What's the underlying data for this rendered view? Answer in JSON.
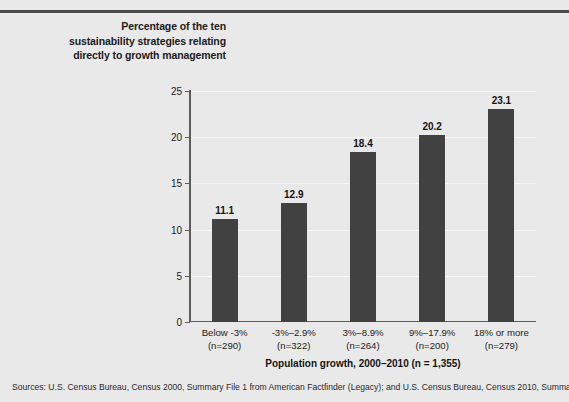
{
  "figure": {
    "top_rule": "horizontal-rule",
    "y_axis_caption": [
      "Percentage of the ten",
      "sustainability strategies relating",
      "directly to growth management"
    ],
    "source_note": "Sources: U.S. Census Bureau, Census 2000, Summary File 1 from American Factfinder (Legacy); and U.S. Census Bureau, Census 2010, Summary",
    "colors": {
      "bar": "#414141",
      "background": "#e9e9e9",
      "axis": "#5b5b5b",
      "gridline": "#f7f7f7",
      "rule": "#4a4a4a"
    }
  },
  "chart_data": {
    "type": "bar",
    "title": "",
    "categories": [
      "Below -3%",
      "-3%–2.9%",
      "3%–8.9%",
      "9%–17.9%",
      "18% or more"
    ],
    "category_sublabels": [
      "(n=290)",
      "(n=322)",
      "(n=264)",
      "(n=200)",
      "(n=279)"
    ],
    "values": [
      11.1,
      12.9,
      18.4,
      20.2,
      23.1
    ],
    "value_labels": [
      "11.1",
      "12.9",
      "18.4",
      "20.2",
      "23.1"
    ],
    "xlabel": "Population growth, 2000–2010 (n = 1,355)",
    "ylabel": "Percentage of the ten sustainability strategies relating directly to growth management",
    "ylim": [
      0,
      25
    ],
    "yticks": [
      0,
      5,
      10,
      15,
      20,
      25
    ],
    "ytick_labels": [
      "0",
      "5",
      "10",
      "15",
      "20",
      "25"
    ],
    "grid": true,
    "legend": "none"
  }
}
